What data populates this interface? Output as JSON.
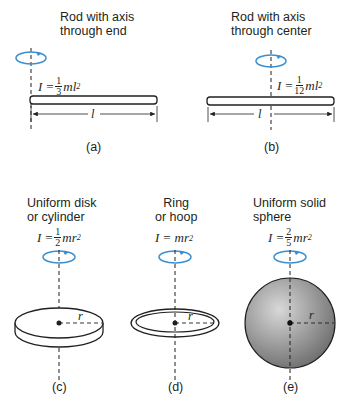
{
  "panels": [
    {
      "id": "a",
      "title_line1": "Rod with axis",
      "title_line2": "through end",
      "formula_lhs": "I =",
      "frac_num": "1",
      "frac_den": "3",
      "formula_rhs": "ml",
      "exp": "2",
      "length_label": "l",
      "label": "(a)"
    },
    {
      "id": "b",
      "title_line1": "Rod with axis",
      "title_line2": "through center",
      "formula_lhs": "I =",
      "frac_num": "1",
      "frac_den": "12",
      "formula_rhs": "ml",
      "exp": "2",
      "length_label": "l",
      "label": "(b)"
    },
    {
      "id": "c",
      "title_line1": "Uniform disk",
      "title_line2": "or cylinder",
      "formula_lhs": "I =",
      "frac_num": "1",
      "frac_den": "2",
      "formula_rhs": "mr",
      "exp": "2",
      "radius_label": "r",
      "label": "(c)"
    },
    {
      "id": "d",
      "title_line1": "Ring",
      "title_line2": "or hoop",
      "formula_lhs": "I = mr",
      "exp": "2",
      "radius_label": "r",
      "label": "(d)"
    },
    {
      "id": "e",
      "title_line1": "Uniform solid",
      "title_line2": "sphere",
      "formula_lhs": "I =",
      "frac_num": "2",
      "frac_den": "5",
      "formula_rhs": "mr",
      "exp": "2",
      "radius_label": "r",
      "label": "(e)"
    }
  ],
  "colors": {
    "rotation_arrow": "#3a8fd0",
    "ink": "#231f20",
    "sphere_light": "#d8d8d8",
    "sphere_dark": "#6e6e6e"
  }
}
